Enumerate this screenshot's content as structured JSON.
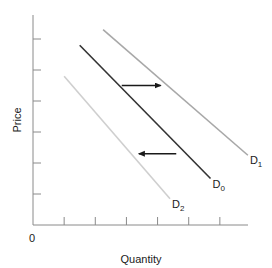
{
  "chart_data": {
    "type": "line",
    "title": "",
    "xlabel": "Quantity",
    "ylabel": "Price",
    "origin_label": "0",
    "xlim": [
      0,
      7
    ],
    "ylim": [
      0,
      7
    ],
    "x_ticks": [
      1,
      2,
      3,
      4,
      5,
      6
    ],
    "y_ticks": [
      1,
      2,
      3,
      4,
      5,
      6
    ],
    "tick_labels_shown": false,
    "grid": false,
    "series": [
      {
        "name": "D1",
        "label_main": "D",
        "label_sub": "1",
        "color": "#a8a8a8",
        "points": [
          [
            2.25,
            6.3
          ],
          [
            6.9,
            2.25
          ]
        ]
      },
      {
        "name": "D0",
        "label_main": "D",
        "label_sub": "0",
        "color": "#333333",
        "points": [
          [
            1.5,
            5.8
          ],
          [
            5.7,
            1.5
          ]
        ]
      },
      {
        "name": "D2",
        "label_main": "D",
        "label_sub": "2",
        "color": "#cfcfcf",
        "points": [
          [
            1.0,
            4.8
          ],
          [
            4.4,
            0.85
          ]
        ]
      }
    ],
    "annotations": [
      {
        "type": "arrow",
        "direction": "right",
        "from": [
          2.85,
          4.5
        ],
        "to": [
          4.1,
          4.5
        ],
        "meaning": "shift from D0 to D1"
      },
      {
        "type": "arrow",
        "direction": "left",
        "from": [
          4.6,
          2.3
        ],
        "to": [
          3.4,
          2.3
        ],
        "meaning": "shift from D0 to D2"
      }
    ]
  }
}
